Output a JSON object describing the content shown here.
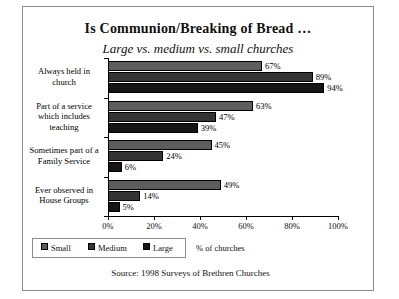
{
  "chart_data": {
    "type": "bar",
    "orientation": "horizontal",
    "title": "Is Communion/Breaking of Bread …",
    "subtitle": "Large vs. medium vs. small churches",
    "xlabel": "% of churches",
    "ylabel": "",
    "xlim": [
      0,
      100
    ],
    "grid": false,
    "legend_position": "bottom-left",
    "categories": [
      "Always held in church",
      "Part of a service which includes teaching",
      "Sometimes part of a Family Service",
      "Ever observed in House Groups"
    ],
    "series": [
      {
        "name": "Small",
        "color": "#5d5d5d",
        "values": [
          67,
          63,
          45,
          49
        ]
      },
      {
        "name": "Medium",
        "color": "#343434",
        "values": [
          89,
          47,
          24,
          14
        ]
      },
      {
        "name": "Large",
        "color": "#151515",
        "values": [
          94,
          39,
          6,
          5
        ]
      }
    ],
    "data_labels": {
      "Small": [
        "67%",
        "63%",
        "45%",
        "49%"
      ],
      "Medium": [
        "89%",
        "47%",
        "24%",
        "14%"
      ],
      "Large": [
        "94%",
        "39%",
        "6%",
        "5%"
      ]
    },
    "xticks": [
      "0%",
      "20%",
      "40%",
      "60%",
      "80%",
      "100%"
    ],
    "xtick_values": [
      0,
      20,
      40,
      60,
      80,
      100
    ],
    "source": "Source: 1998 Surveys of Brethren Churches"
  },
  "category_lines": [
    [
      "Always held in",
      "church"
    ],
    [
      "Part of a service",
      "which includes",
      "teaching"
    ],
    [
      "Sometimes part of a",
      "Family Service"
    ],
    [
      "Ever observed in",
      "House Groups"
    ]
  ]
}
